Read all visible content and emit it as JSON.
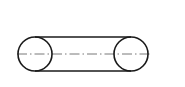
{
  "diagram": {
    "stroke_color": "#1a1a1a",
    "centerline_color": "#555555",
    "background": "#ffffff",
    "pulleys": [
      {
        "name": "left-pulley",
        "cx": 35,
        "cy": 54,
        "r": 17
      },
      {
        "name": "right-pulley",
        "cx": 131,
        "cy": 54,
        "r": 17
      }
    ],
    "belt": {
      "top": {
        "x1": 35,
        "y1": 37,
        "x2": 131,
        "y2": 37
      },
      "bottom": {
        "x1": 35,
        "y1": 71,
        "x2": 131,
        "y2": 71
      }
    },
    "centerline": {
      "x1": 17,
      "y1": 54,
      "x2": 152,
      "y2": 54,
      "dasharray": "10 3 1.5 3"
    }
  }
}
